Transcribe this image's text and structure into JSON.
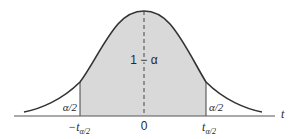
{
  "figure": {
    "type": "t-distribution confidence interval diagram",
    "colors": {
      "curve": "#333333",
      "shaded_region": "#d9d9d9",
      "axis": "#555555",
      "text": "#2a2a2a"
    },
    "labels": {
      "center_area": "1 − α",
      "left_tail": "α/2",
      "right_tail": "α/2",
      "axis_variable": "t",
      "tick_left_main": "−t",
      "tick_left_sub": "α/2",
      "tick_center": "0",
      "tick_right_main": "t",
      "tick_right_sub": "α/2"
    }
  }
}
